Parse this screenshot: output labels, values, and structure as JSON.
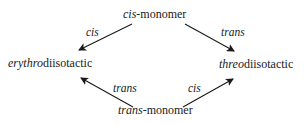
{
  "diagram": {
    "nodes": {
      "cis_monomer": {
        "prefix": "cis",
        "suffix": "-monomer"
      },
      "trans_monomer": {
        "prefix": "trans",
        "suffix": "-monomer"
      },
      "erythro": {
        "prefix": "erythro",
        "suffix": "diisotactic"
      },
      "threo": {
        "prefix": "threo",
        "suffix": "diisotactic"
      }
    },
    "edges": [
      {
        "from": "cis-monomer",
        "to": "erythrodiisotactic",
        "label": "cis"
      },
      {
        "from": "cis-monomer",
        "to": "threodiisotactic",
        "label": "trans"
      },
      {
        "from": "trans-monomer",
        "to": "erythrodiisotactic",
        "label": "trans"
      },
      {
        "from": "trans-monomer",
        "to": "threodiisotactic",
        "label": "cis"
      }
    ]
  }
}
